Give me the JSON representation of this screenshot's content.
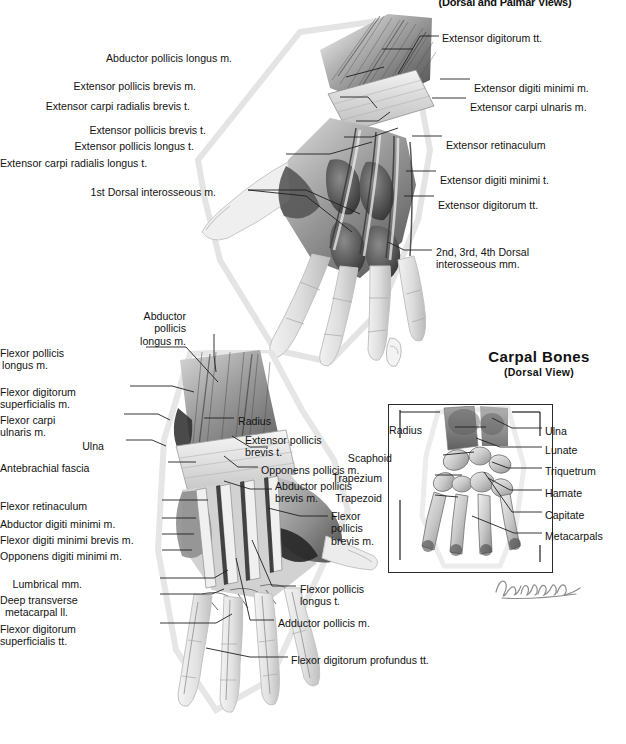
{
  "plate": {
    "subtitle": "(Dorsal and Palmar Views)"
  },
  "inset": {
    "title": "Carpal Bones",
    "subtitle": "(Dorsal View)",
    "signature_alt": "artist-signature"
  },
  "dorsal_view": {
    "labels_left": [
      {
        "text": "Abductor pollicis longus m.",
        "x": 232,
        "y": 52
      },
      {
        "text": "Extensor pollicis brevis m.",
        "x": 196,
        "y": 80
      },
      {
        "text": "Extensor carpi radialis brevis t.",
        "x": 190,
        "y": 100
      },
      {
        "text": "Extensor pollicis brevis t.",
        "x": 206,
        "y": 124
      },
      {
        "text": "Extensor pollicis longus t.",
        "x": 194,
        "y": 140
      },
      {
        "text": "Extensor carpi radialis longus t.",
        "x": 136,
        "y": 157
      },
      {
        "text": "1st Dorsal interosseous m.",
        "x": 216,
        "y": 186
      }
    ],
    "labels_right": [
      {
        "text": "Extensor digitorum tt.",
        "x": 442,
        "y": 32
      },
      {
        "text": "Extensor digiti minimi m.",
        "x": 474,
        "y": 82
      },
      {
        "text": "Extensor carpi ulnaris m.",
        "x": 470,
        "y": 101
      },
      {
        "text": "Extensor retinaculum",
        "x": 446,
        "y": 139
      },
      {
        "text": "Extensor digiti minimi t.",
        "x": 440,
        "y": 174
      },
      {
        "text": "Extensor digitorum tt.",
        "x": 438,
        "y": 199
      },
      {
        "text": "2nd, 3rd, 4th Dorsal\ninteros­seous mm.",
        "x": 436,
        "y": 246
      }
    ]
  },
  "palmar_view": {
    "labels_left": [
      {
        "text": "Abductor\npollicis\nlongus m.",
        "x": 186,
        "y": 310
      },
      {
        "text": "Flexor pollicis\nlongus m.",
        "x": 48,
        "y": 347
      },
      {
        "text": "Flexor digitorum\nsuperficialis m.",
        "x": 26,
        "y": 386
      },
      {
        "text": "Flexor carpi\nulnaris m.",
        "x": 44,
        "y": 414
      },
      {
        "text": "Ulna",
        "x": 104,
        "y": 440
      },
      {
        "text": "Antebrachial fascia",
        "x": 68,
        "y": 462
      },
      {
        "text": "Flexor retinaculum",
        "x": 56,
        "y": 500
      },
      {
        "text": "Abductor digiti minimi m.",
        "x": 28,
        "y": 518
      },
      {
        "text": "Flexor digiti minimi brevis m.",
        "x": 10,
        "y": 534
      },
      {
        "text": "Opponens digiti minimi m.",
        "x": 22,
        "y": 550
      },
      {
        "text": "Lumbrical mm.",
        "x": 82,
        "y": 578
      },
      {
        "text": "Deep transverse\nmetacarpal ll.",
        "x": 68,
        "y": 594
      },
      {
        "text": "Flexor digitorum\nsuperficialis tt.",
        "x": 64,
        "y": 623
      }
    ],
    "labels_right": [
      {
        "text": "Radius",
        "x": 238,
        "y": 415
      },
      {
        "text": "Extensor pollicis\nbrevis t.",
        "x": 245,
        "y": 434
      },
      {
        "text": "Opponens pollicis m.",
        "x": 261,
        "y": 464
      },
      {
        "text": "Abductor pollicis\nbrevis m.",
        "x": 275,
        "y": 480
      },
      {
        "text": "Flexor\npollicis\nbrevis m.",
        "x": 331,
        "y": 510
      },
      {
        "text": "Flexor pollicis\nlongus t.",
        "x": 300,
        "y": 583
      },
      {
        "text": "Adductor pollicis m.",
        "x": 278,
        "y": 617
      },
      {
        "text": "Flexor digitorum profundus tt.",
        "x": 291,
        "y": 654
      }
    ]
  },
  "carpal_bones": {
    "labels_left": [
      {
        "text": "Radius",
        "x": 422,
        "y": 424
      },
      {
        "text": "Scaphoid",
        "x": 392,
        "y": 452
      },
      {
        "text": "Trapezium",
        "x": 382,
        "y": 472
      },
      {
        "text": "Trapezoid",
        "x": 382,
        "y": 492
      }
    ],
    "labels_right": [
      {
        "text": "Ulna",
        "x": 545,
        "y": 425
      },
      {
        "text": "Lunate",
        "x": 545,
        "y": 444
      },
      {
        "text": "Triquetrum",
        "x": 545,
        "y": 465
      },
      {
        "text": "Hamate",
        "x": 545,
        "y": 487
      },
      {
        "text": "Capitate",
        "x": 545,
        "y": 509
      },
      {
        "text": "Metacarpals",
        "x": 545,
        "y": 530
      }
    ]
  },
  "colors": {
    "ink": "#131313",
    "leader": "#1f1f1f",
    "frame": "#2b2b2b",
    "paper": "#ffffff",
    "tissue_light": "#e9e9e9",
    "tissue_mid": "#b9b9b9",
    "tissue_dark": "#6a6a6a",
    "tissue_deep": "#3a3a3a",
    "outline_halo": "#e4e4e4"
  }
}
